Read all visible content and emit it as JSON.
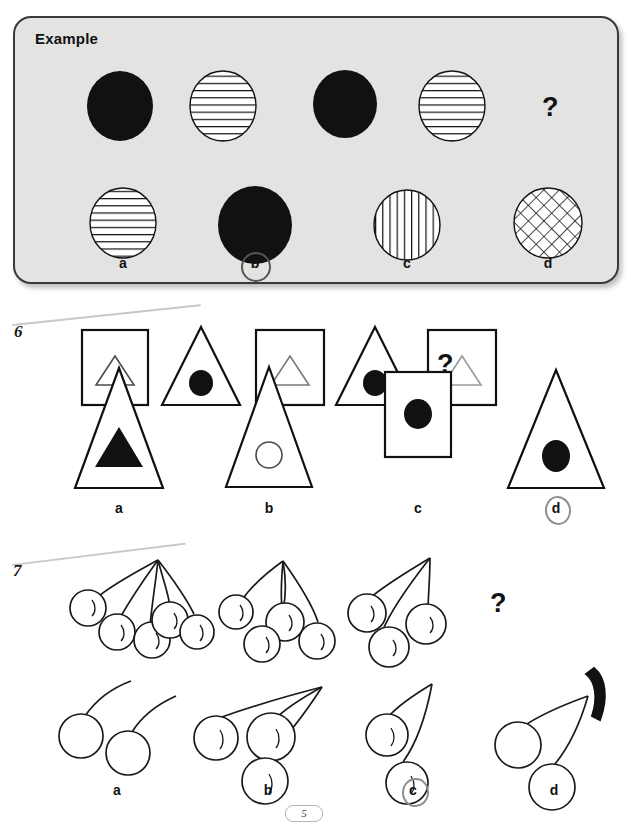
{
  "page": {
    "page_number": "5",
    "background_color": "#ffffff"
  },
  "example": {
    "title": "Example",
    "box_color": "#e3e3e1",
    "border_color": "#3a3a3a",
    "question_mark": "?",
    "sequence": [
      {
        "name": "circle-solid-black",
        "fill": "solid"
      },
      {
        "name": "circle-horizontal-stripes",
        "fill": "horizontal"
      },
      {
        "name": "circle-solid-black",
        "fill": "solid"
      },
      {
        "name": "circle-horizontal-stripes",
        "fill": "horizontal"
      },
      {
        "name": "question-mark",
        "fill": "none"
      }
    ],
    "options": [
      {
        "label": "a",
        "name": "circle-horizontal-stripes",
        "fill": "horizontal",
        "selected": false
      },
      {
        "label": "b",
        "name": "circle-solid-black",
        "fill": "solid",
        "selected": true
      },
      {
        "label": "c",
        "name": "circle-vertical-stripes",
        "fill": "vertical",
        "selected": false
      },
      {
        "label": "d",
        "name": "circle-cross-hatch",
        "fill": "crosshatch",
        "selected": false
      }
    ]
  },
  "question6": {
    "number": "6",
    "question_mark": "?",
    "sequence": [
      {
        "outer": "square",
        "inner": "triangle-outline"
      },
      {
        "outer": "triangle",
        "inner": "circle-solid"
      },
      {
        "outer": "square",
        "inner": "triangle-outline"
      },
      {
        "outer": "triangle",
        "inner": "circle-solid"
      },
      {
        "outer": "square",
        "inner": "triangle-outline"
      },
      {
        "outer": "question-mark",
        "inner": "none"
      }
    ],
    "options": [
      {
        "label": "a",
        "outer": "triangle",
        "inner": "triangle-solid",
        "selected": false
      },
      {
        "label": "b",
        "outer": "triangle",
        "inner": "circle-outline",
        "selected": false
      },
      {
        "label": "c",
        "outer": "square",
        "inner": "circle-solid",
        "selected": false
      },
      {
        "label": "d",
        "outer": "triangle",
        "inner": "circle-solid",
        "selected": true
      }
    ]
  },
  "question7": {
    "number": "7",
    "question_mark": "?",
    "sequence": [
      {
        "name": "cherry-cluster-5",
        "cherry_count": 5
      },
      {
        "name": "cherry-cluster-4",
        "cherry_count": 4
      },
      {
        "name": "cherry-cluster-3",
        "cherry_count": 3
      },
      {
        "name": "question-mark",
        "cherry_count": 0
      }
    ],
    "options": [
      {
        "label": "a",
        "name": "cherries-two-separate-stems",
        "cherry_count": 2,
        "selected": false
      },
      {
        "label": "b",
        "name": "cherry-cluster-3",
        "cherry_count": 3,
        "selected": false
      },
      {
        "label": "c",
        "name": "cherry-cluster-2",
        "cherry_count": 2,
        "selected": true
      },
      {
        "label": "d",
        "name": "cherry-cluster-2-black-stem-cap",
        "cherry_count": 2,
        "selected": false
      }
    ]
  }
}
